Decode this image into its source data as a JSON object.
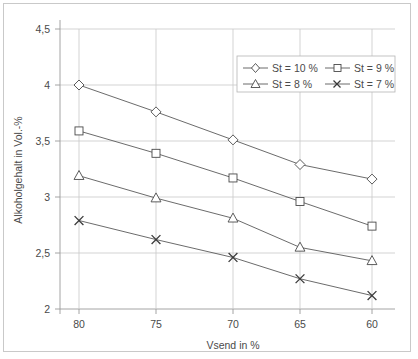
{
  "chart_data": {
    "type": "line",
    "title": "",
    "subtitle": "",
    "xlabel": "Vsend in %",
    "ylabel": "Alkoholgehalt in Vol.-%",
    "categories": [
      "80",
      "75",
      "70",
      "65",
      "60"
    ],
    "x": [
      80,
      75,
      70,
      65,
      60
    ],
    "xtick_labels": [
      "80",
      "75",
      "70",
      "65",
      "60"
    ],
    "ytick_labels": [
      "2",
      "2,5",
      "3",
      "3,5",
      "4",
      "4,5"
    ],
    "yticks": [
      2,
      2.5,
      3,
      3.5,
      4,
      4.5
    ],
    "ylim": [
      2,
      4.5
    ],
    "grid": true,
    "legend_position": "top-right",
    "series": [
      {
        "name": "St = 10 %",
        "marker": "diamond",
        "values": [
          4.0,
          3.76,
          3.51,
          3.29,
          3.16
        ]
      },
      {
        "name": "St = 9 %",
        "marker": "square",
        "values": [
          3.59,
          3.39,
          3.17,
          2.96,
          2.74
        ]
      },
      {
        "name": "St = 8 %",
        "marker": "triangle",
        "values": [
          3.19,
          2.99,
          2.81,
          2.55,
          2.43
        ]
      },
      {
        "name": "St = 7 %",
        "marker": "x",
        "values": [
          2.79,
          2.62,
          2.46,
          2.27,
          2.12
        ]
      }
    ],
    "colors": {
      "line": "#5a5a5a",
      "marker_stroke": "#4a4a4a",
      "marker_fill": "#ffffff",
      "grid": "#c8c8c8",
      "axis": "#9a9a9a",
      "text": "#4a4a4a",
      "background": "#ffffff",
      "frame": "#c9c9c9"
    }
  },
  "legend": {
    "entries": [
      {
        "label": "St = 10 %",
        "marker": "diamond"
      },
      {
        "label": "St = 9 %",
        "marker": "square"
      },
      {
        "label": "St = 8 %",
        "marker": "triangle"
      },
      {
        "label": "St = 7 %",
        "marker": "x"
      }
    ]
  },
  "axes": {
    "y_title": "Alkoholgehalt in Vol.-%",
    "x_title": "Vsend in %",
    "y_ticks": [
      "4,5",
      "4",
      "3,5",
      "3",
      "2,5",
      "2"
    ],
    "x_ticks": [
      "80",
      "75",
      "70",
      "65",
      "60"
    ]
  }
}
